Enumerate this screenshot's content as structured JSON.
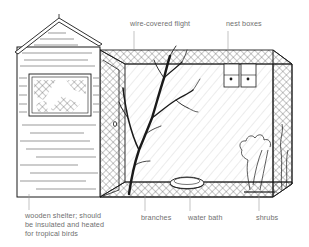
{
  "diagram": {
    "labels": {
      "flight": "wire-covered flight",
      "nest_boxes": "nest boxes",
      "shelter_line1": "wooden shelter; should",
      "shelter_line2": "be insulated and heated",
      "shelter_line3": "for tropical birds",
      "branches": "branches",
      "water_bath": "water bath",
      "shrubs": "shrubs"
    },
    "colors": {
      "ink": "#1a1a1a",
      "mesh": "#3a3a3a",
      "label_text": "#6f6f6f",
      "leader": "#9a9a9a",
      "background": "#ffffff"
    }
  }
}
